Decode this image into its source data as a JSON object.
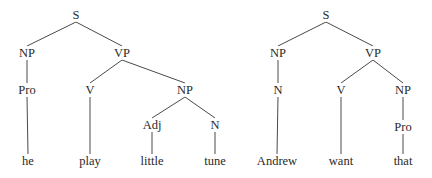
{
  "diagram": {
    "type": "syntax-trees",
    "trees": [
      {
        "id": "tree-1",
        "sentence": [
          "he",
          "play",
          "little",
          "tune"
        ],
        "nodes": [
          {
            "id": "t1-S",
            "label": "S",
            "x": 76,
            "y": 15
          },
          {
            "id": "t1-NP",
            "label": "NP",
            "x": 27,
            "y": 53
          },
          {
            "id": "t1-VP",
            "label": "VP",
            "x": 122,
            "y": 53
          },
          {
            "id": "t1-Pro",
            "label": "Pro",
            "x": 27,
            "y": 90
          },
          {
            "id": "t1-V",
            "label": "V",
            "x": 90,
            "y": 90
          },
          {
            "id": "t1-NP2",
            "label": "NP",
            "x": 185,
            "y": 90
          },
          {
            "id": "t1-Adj",
            "label": "Adj",
            "x": 152,
            "y": 125
          },
          {
            "id": "t1-N",
            "label": "N",
            "x": 215,
            "y": 125
          },
          {
            "id": "t1-he",
            "label": "he",
            "x": 28,
            "y": 161
          },
          {
            "id": "t1-play",
            "label": "play",
            "x": 90,
            "y": 161
          },
          {
            "id": "t1-little",
            "label": "little",
            "x": 152,
            "y": 161
          },
          {
            "id": "t1-tune",
            "label": "tune",
            "x": 215,
            "y": 161
          }
        ],
        "edges": [
          [
            "t1-S",
            "t1-NP"
          ],
          [
            "t1-S",
            "t1-VP"
          ],
          [
            "t1-NP",
            "t1-Pro"
          ],
          [
            "t1-VP",
            "t1-V"
          ],
          [
            "t1-VP",
            "t1-NP2"
          ],
          [
            "t1-NP2",
            "t1-Adj"
          ],
          [
            "t1-NP2",
            "t1-N"
          ],
          [
            "t1-Pro",
            "t1-he"
          ],
          [
            "t1-V",
            "t1-play"
          ],
          [
            "t1-Adj",
            "t1-little"
          ],
          [
            "t1-N",
            "t1-tune"
          ]
        ]
      },
      {
        "id": "tree-2",
        "sentence": [
          "Andrew",
          "want",
          "that"
        ],
        "nodes": [
          {
            "id": "t2-S",
            "label": "S",
            "x": 326,
            "y": 15
          },
          {
            "id": "t2-NP",
            "label": "NP",
            "x": 278,
            "y": 53
          },
          {
            "id": "t2-VP",
            "label": "VP",
            "x": 373,
            "y": 53
          },
          {
            "id": "t2-N",
            "label": "N",
            "x": 278,
            "y": 90
          },
          {
            "id": "t2-V",
            "label": "V",
            "x": 341,
            "y": 90
          },
          {
            "id": "t2-NP2",
            "label": "NP",
            "x": 403,
            "y": 90
          },
          {
            "id": "t2-Pro",
            "label": "Pro",
            "x": 403,
            "y": 127
          },
          {
            "id": "t2-Andrew",
            "label": "Andrew",
            "x": 277,
            "y": 161
          },
          {
            "id": "t2-want",
            "label": "want",
            "x": 341,
            "y": 161
          },
          {
            "id": "t2-that",
            "label": "that",
            "x": 403,
            "y": 161
          }
        ],
        "edges": [
          [
            "t2-S",
            "t2-NP"
          ],
          [
            "t2-S",
            "t2-VP"
          ],
          [
            "t2-NP",
            "t2-N"
          ],
          [
            "t2-VP",
            "t2-V"
          ],
          [
            "t2-VP",
            "t2-NP2"
          ],
          [
            "t2-NP2",
            "t2-Pro"
          ],
          [
            "t2-N",
            "t2-Andrew"
          ],
          [
            "t2-V",
            "t2-want"
          ],
          [
            "t2-Pro",
            "t2-that"
          ]
        ]
      }
    ],
    "colors": {
      "background": "#ffffff",
      "text": "#2a2a2a",
      "line": "#4a4a4a"
    }
  }
}
